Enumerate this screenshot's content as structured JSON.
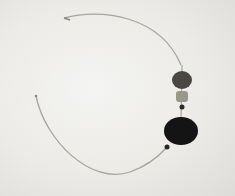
{
  "image": {
    "subject": "wire necklace with beads",
    "background_color": "#ecebe8",
    "wire_color": "#a8a49c",
    "beads": [
      {
        "name": "large-dark-round-bead",
        "cx": 182,
        "cy": 80,
        "r": 10,
        "color": "#4a4642"
      },
      {
        "name": "light-cylinder-bead",
        "cx": 182,
        "cy": 97,
        "r": 6,
        "color": "#9a968e"
      },
      {
        "name": "small-dark-bead-upper",
        "cx": 182,
        "cy": 107,
        "r": 2.5,
        "color": "#2a2826"
      },
      {
        "name": "large-black-disc-pendant",
        "cx": 181,
        "cy": 130,
        "r": 16,
        "color": "#141414"
      },
      {
        "name": "small-dark-bead-lower",
        "cx": 167,
        "cy": 147,
        "r": 2.5,
        "color": "#2a2826"
      }
    ]
  }
}
